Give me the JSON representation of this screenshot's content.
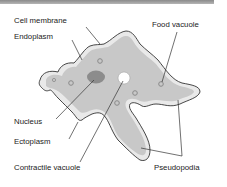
{
  "diagram": {
    "colors": {
      "cytoplasm": "#c8c8c8",
      "ectoplasm": "#e9e9e9",
      "nucleus": "#8c8c8c",
      "outline": "#333333",
      "vacuole_ring": "#8a8a8a"
    },
    "labels": {
      "cell_membrane": "Cell membrane",
      "endoplasm": "Endoplasm",
      "food_vacuole": "Food vacuole",
      "nucleus": "Nucleus",
      "ectoplasm": "Ectoplasm",
      "contractile_vacuole": "Contractile vacuole",
      "pseudopodia": "Pseudopodia"
    }
  }
}
